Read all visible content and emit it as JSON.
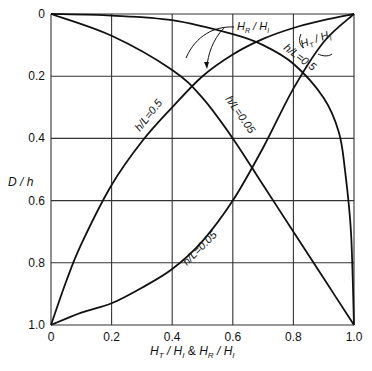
{
  "chart_data": {
    "type": "line",
    "title": "",
    "xlabel": "H_T / H_I & H_R / H_I",
    "ylabel": "D / h",
    "xlim": [
      0,
      1.0
    ],
    "ylim": [
      0,
      1.0
    ],
    "y_inverted": true,
    "grid": true,
    "x_ticks": [
      "0",
      "0.2",
      "0.4",
      "0.6",
      "0.8",
      "1.0"
    ],
    "y_ticks": [
      "0",
      "0.2",
      "0.4",
      "0.6",
      "0.8",
      "1.0"
    ],
    "series": [
      {
        "name": "H_T/H_I, h/L=0.5",
        "x": [
          0,
          0.05,
          0.1,
          0.2,
          0.3,
          0.4,
          0.5,
          0.6,
          0.7,
          0.8,
          0.9,
          1.0
        ],
        "y": [
          1.0,
          0.86,
          0.74,
          0.55,
          0.41,
          0.3,
          0.2,
          0.13,
          0.08,
          0.045,
          0.02,
          0
        ]
      },
      {
        "name": "H_T/H_I, h/L=0.05",
        "x": [
          0,
          0.1,
          0.2,
          0.3,
          0.4,
          0.5,
          0.6,
          0.7,
          0.8,
          0.9,
          1.0
        ],
        "y": [
          1.0,
          0.96,
          0.93,
          0.88,
          0.82,
          0.73,
          0.6,
          0.43,
          0.24,
          0.09,
          0
        ]
      },
      {
        "name": "H_R/H_I, h/L=0.5",
        "x": [
          0,
          0.2,
          0.4,
          0.6,
          0.7,
          0.8,
          0.9,
          0.95,
          0.97,
          0.99,
          1.0
        ],
        "y": [
          0,
          0.005,
          0.02,
          0.065,
          0.1,
          0.16,
          0.27,
          0.38,
          0.5,
          0.7,
          1.0
        ]
      },
      {
        "name": "H_R/H_I, h/L=0.05",
        "x": [
          0,
          0.2,
          0.4,
          0.5,
          0.6,
          0.7,
          0.8,
          0.9,
          1.0
        ],
        "y": [
          0,
          0.07,
          0.18,
          0.27,
          0.4,
          0.55,
          0.7,
          0.85,
          1.0
        ]
      }
    ],
    "annotations": [
      {
        "text": "H_R / H_I",
        "target": "H_R/H_I curves"
      },
      {
        "text": "H_T / H_I",
        "target": "H_T/H_I curves"
      },
      {
        "text": "h/L=0.5",
        "on": "H_T/H_I, h/L=0.5"
      },
      {
        "text": "h/L=0.5",
        "on": "H_R/H_I, h/L=0.5"
      },
      {
        "text": "h/L=0.05",
        "on": "H_R/H_I, h/L=0.05"
      },
      {
        "text": "h/L=0.05",
        "on": "H_T/H_I, h/L=0.05"
      }
    ]
  },
  "labels": {
    "xlabel_ht": "H",
    "xlabel_ht_sub": "T",
    "xlabel_hi": "H",
    "xlabel_hi_sub": "I",
    "xlabel_amp": "&",
    "xlabel_hr": "H",
    "xlabel_hr_sub": "R",
    "ylabel": "D / h",
    "ann_hr": "H",
    "ann_hr_sub": "R",
    "ann_hi": "H",
    "ann_hi_sub": "I",
    "ann_ht": "H",
    "ann_ht_sub": "T",
    "hl_05": "h/L=0.5",
    "hl_005": "h/L=0.05"
  }
}
